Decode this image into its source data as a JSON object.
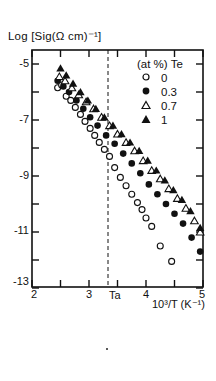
{
  "chart_data": {
    "type": "scatter",
    "title": "",
    "ylabel": "Log [Sig(Ω cm)^-1]",
    "xlabel": "10^3/T (K^-1)",
    "xlim": [
      2,
      5
    ],
    "ylim": [
      -13,
      -4.5
    ],
    "xticks": [
      2,
      3,
      4,
      5
    ],
    "yticks": [
      -5,
      -7,
      -9,
      -11,
      -13
    ],
    "grid": false,
    "annotations": [
      {
        "text": "Ta",
        "x": 3.33,
        "style": "dashed vertical line"
      }
    ],
    "legend": {
      "title": "(at %) Te",
      "position": "upper right"
    },
    "series": [
      {
        "name": "0",
        "marker": "open-circle",
        "x": [
          2.45,
          2.52,
          2.6,
          2.68,
          2.76,
          2.85,
          2.93,
          3.02,
          3.1,
          3.18,
          3.27,
          3.36,
          3.45,
          3.55,
          3.65,
          3.75,
          3.85,
          3.93,
          4.0,
          4.1,
          4.25,
          4.45
        ],
        "y": [
          -5.85,
          -5.75,
          -6.15,
          -6.3,
          -6.55,
          -6.8,
          -7.05,
          -7.3,
          -7.55,
          -7.8,
          -8.05,
          -8.3,
          -8.7,
          -9.05,
          -9.35,
          -9.65,
          -9.95,
          -10.2,
          -10.5,
          -10.8,
          -11.5,
          -12.05
        ]
      },
      {
        "name": "0.3",
        "marker": "filled-circle",
        "x": [
          2.45,
          2.55,
          2.65,
          2.78,
          2.9,
          3.02,
          3.15,
          3.3,
          3.45,
          3.6,
          3.75,
          3.9,
          4.05,
          4.2,
          4.35,
          4.5,
          4.65,
          4.8,
          4.95
        ],
        "y": [
          -5.6,
          -5.8,
          -6.0,
          -6.3,
          -6.6,
          -6.9,
          -7.2,
          -7.55,
          -7.85,
          -8.2,
          -8.55,
          -8.9,
          -9.3,
          -9.65,
          -10.0,
          -10.35,
          -10.7,
          -11.2,
          -11.7
        ]
      },
      {
        "name": "0.7",
        "marker": "open-triangle",
        "x": [
          2.48,
          2.58,
          2.7,
          2.82,
          2.95,
          3.08,
          3.22,
          3.36,
          3.5,
          3.65,
          3.8,
          3.95,
          4.1,
          4.25,
          4.4,
          4.55,
          4.7,
          4.85,
          4.95
        ],
        "y": [
          -5.45,
          -5.6,
          -5.85,
          -6.1,
          -6.35,
          -6.6,
          -6.9,
          -7.2,
          -7.5,
          -7.8,
          -8.1,
          -8.45,
          -8.8,
          -9.1,
          -9.45,
          -9.8,
          -10.15,
          -10.6,
          -11.0
        ]
      },
      {
        "name": "1",
        "marker": "filled-triangle",
        "x": [
          2.5,
          2.6,
          2.72,
          2.85,
          2.98,
          3.12,
          3.27,
          3.42,
          3.57,
          3.72,
          3.88,
          4.03,
          4.18,
          4.33,
          4.48,
          4.63,
          4.78,
          4.95
        ],
        "y": [
          -5.15,
          -5.4,
          -5.7,
          -6.0,
          -6.3,
          -6.6,
          -6.9,
          -7.2,
          -7.5,
          -7.8,
          -8.1,
          -8.45,
          -8.8,
          -9.15,
          -9.5,
          -9.85,
          -10.25,
          -10.85
        ]
      }
    ]
  },
  "labels": {
    "ylabel": "Log [Sig(Ω cm)⁻¹]",
    "xlabel": "10³/T (K⁻¹)",
    "ta": "Ta",
    "legend_title": "(at %) Te",
    "legend_items": [
      "0",
      "0.3",
      "0.7",
      "1"
    ],
    "yticks": [
      "-5",
      "-7",
      "-9",
      "-11",
      "-13"
    ],
    "xticks": [
      "2",
      "3",
      "4",
      "5"
    ]
  }
}
